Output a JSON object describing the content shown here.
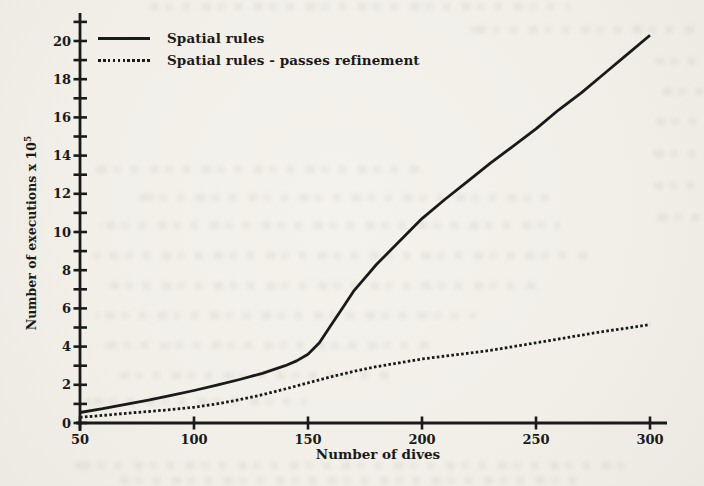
{
  "colors": {
    "ink": "#1a1a1a",
    "paper": "#f1efe8"
  },
  "chart_data": {
    "type": "line",
    "title": "",
    "xlabel": "Number of dives",
    "ylabel_base": "Number of executions x 10",
    "ylabel_exponent": "5",
    "xlim": [
      50,
      300
    ],
    "ylim": [
      0,
      21
    ],
    "grid": false,
    "legend_position": "top-left",
    "x_ticks": [
      50,
      100,
      150,
      200,
      250,
      300
    ],
    "y_tick_labels": [
      0,
      2,
      4,
      6,
      8,
      10,
      12,
      14,
      16,
      18,
      20
    ],
    "y_minor_step": 1,
    "series": [
      {
        "name": "Spatial rules",
        "style": "solid",
        "points": [
          [
            50,
            0.55
          ],
          [
            60,
            0.75
          ],
          [
            70,
            0.98
          ],
          [
            80,
            1.2
          ],
          [
            90,
            1.45
          ],
          [
            100,
            1.7
          ],
          [
            110,
            1.98
          ],
          [
            120,
            2.28
          ],
          [
            130,
            2.6
          ],
          [
            140,
            3.0
          ],
          [
            145,
            3.25
          ],
          [
            150,
            3.6
          ],
          [
            155,
            4.2
          ],
          [
            160,
            5.1
          ],
          [
            165,
            6.0
          ],
          [
            170,
            6.9
          ],
          [
            175,
            7.6
          ],
          [
            180,
            8.3
          ],
          [
            190,
            9.5
          ],
          [
            200,
            10.7
          ],
          [
            210,
            11.7
          ],
          [
            220,
            12.65
          ],
          [
            230,
            13.6
          ],
          [
            240,
            14.5
          ],
          [
            250,
            15.4
          ],
          [
            260,
            16.4
          ],
          [
            270,
            17.3
          ],
          [
            280,
            18.3
          ],
          [
            290,
            19.3
          ],
          [
            300,
            20.3
          ]
        ]
      },
      {
        "name": "Spatial rules - passes refinement",
        "style": "dotted",
        "points": [
          [
            50,
            0.3
          ],
          [
            60,
            0.4
          ],
          [
            70,
            0.5
          ],
          [
            80,
            0.6
          ],
          [
            90,
            0.7
          ],
          [
            100,
            0.82
          ],
          [
            110,
            1.0
          ],
          [
            120,
            1.22
          ],
          [
            130,
            1.48
          ],
          [
            140,
            1.78
          ],
          [
            150,
            2.1
          ],
          [
            160,
            2.42
          ],
          [
            170,
            2.7
          ],
          [
            180,
            2.95
          ],
          [
            190,
            3.15
          ],
          [
            200,
            3.35
          ],
          [
            210,
            3.5
          ],
          [
            220,
            3.65
          ],
          [
            230,
            3.8
          ],
          [
            240,
            4.0
          ],
          [
            250,
            4.2
          ],
          [
            260,
            4.4
          ],
          [
            270,
            4.6
          ],
          [
            280,
            4.8
          ],
          [
            290,
            4.97
          ],
          [
            300,
            5.15
          ]
        ]
      }
    ]
  }
}
